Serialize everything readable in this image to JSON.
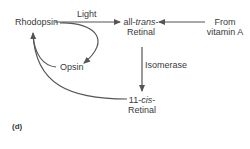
{
  "diagram": {
    "nodes": {
      "rhodopsin": "Rhodopsin",
      "opsin": "Opsin",
      "all_trans_prefix": "all-",
      "all_trans_italic": "trans",
      "all_trans_suffix": "-",
      "all_trans_line2": "Retinal",
      "cis_prefix": "11-",
      "cis_italic": "cis",
      "cis_suffix": "-",
      "cis_line2": "Retinal",
      "from_line1": "From",
      "from_line2": "vitamin A"
    },
    "edge_labels": {
      "light": "Light",
      "isomerase": "Isomerase"
    },
    "figure_label": "(d)",
    "edges": [
      {
        "from": "Rhodopsin",
        "to": "all-trans-Retinal",
        "label": "Light"
      },
      {
        "from": "Rhodopsin",
        "to": "Opsin",
        "label": ""
      },
      {
        "from": "From vitamin A",
        "to": "all-trans-Retinal",
        "label": ""
      },
      {
        "from": "all-trans-Retinal",
        "to": "11-cis-Retinal",
        "label": "Isomerase"
      },
      {
        "from": "11-cis-Retinal",
        "to": "Rhodopsin",
        "label": ""
      },
      {
        "from": "Opsin",
        "to": "Rhodopsin",
        "label": ""
      }
    ]
  },
  "colors": {
    "stroke": "#555555",
    "text": "#3a3a3a"
  }
}
